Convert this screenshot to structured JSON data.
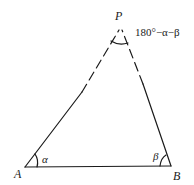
{
  "diagram": {
    "type": "triangle",
    "vertices": {
      "P": {
        "label": "P",
        "x": 121,
        "y": 26
      },
      "A": {
        "label": "A",
        "x": 25,
        "y": 167
      },
      "B": {
        "label": "B",
        "x": 171,
        "y": 166
      }
    },
    "angles": {
      "A": {
        "label": "α"
      },
      "B": {
        "label": "β"
      },
      "P": {
        "label": "180°−α−β"
      }
    },
    "edges": [
      {
        "from": "A",
        "to": "B",
        "style": "solid"
      },
      {
        "from": "A",
        "to": "P",
        "style": "solid-then-dashed"
      },
      {
        "from": "B",
        "to": "P",
        "style": "solid-then-dashed"
      }
    ],
    "colors": {
      "stroke": "#1a1a1a",
      "background": "#ffffff"
    }
  }
}
